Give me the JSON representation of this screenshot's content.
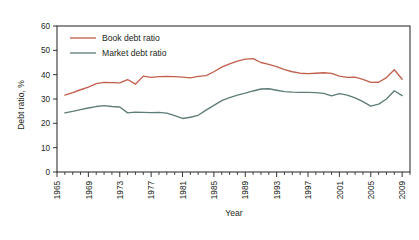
{
  "chart_data": {
    "type": "line",
    "title": "",
    "xlabel": "Year",
    "ylabel": "Debt ratio, %",
    "ylim": [
      0,
      60
    ],
    "xlim": [
      1965,
      2010
    ],
    "yticks": [
      0,
      10,
      20,
      30,
      40,
      50,
      60
    ],
    "xticks": [
      1965,
      1969,
      1973,
      1977,
      1981,
      1985,
      1989,
      1993,
      1997,
      2001,
      2005,
      2009
    ],
    "xtick_labels": [
      "1965",
      "1969",
      "1973",
      "1977",
      "1981",
      "1985",
      "1989",
      "1993",
      "1997",
      "2001",
      "2005",
      "2009"
    ],
    "ytick_labels": [
      "0",
      "10",
      "20",
      "30",
      "40",
      "50",
      "60"
    ],
    "grid": false,
    "legend_position": "top-left",
    "minor_ticks": "every year",
    "x": [
      1966,
      1967,
      1968,
      1969,
      1970,
      1971,
      1972,
      1973,
      1974,
      1975,
      1976,
      1977,
      1978,
      1979,
      1980,
      1981,
      1982,
      1983,
      1984,
      1985,
      1986,
      1987,
      1988,
      1989,
      1990,
      1991,
      1992,
      1993,
      1994,
      1995,
      1996,
      1997,
      1998,
      1999,
      2000,
      2001,
      2002,
      2003,
      2004,
      2005,
      2006,
      2007,
      2008,
      2009
    ],
    "series": [
      {
        "name": "Book debt ratio",
        "color": "#c2604e",
        "values": [
          31.6,
          32.6,
          33.8,
          34.9,
          36.3,
          36.8,
          36.7,
          36.6,
          38.0,
          36.1,
          39.4,
          38.9,
          39.2,
          39.3,
          39.2,
          39.0,
          38.7,
          39.3,
          39.6,
          41.2,
          43.1,
          44.4,
          45.6,
          46.4,
          46.6,
          45.0,
          44.2,
          43.3,
          42.1,
          41.2,
          40.6,
          40.4,
          40.6,
          40.8,
          40.5,
          39.4,
          38.9,
          39.0,
          38.1,
          36.8,
          36.9,
          38.8,
          42.0,
          38.1
        ]
      },
      {
        "name": "Market debt ratio",
        "color": "#5f7d78",
        "values": [
          24.3,
          24.9,
          25.6,
          26.3,
          26.9,
          27.3,
          26.9,
          26.7,
          24.3,
          24.6,
          24.5,
          24.4,
          24.5,
          24.2,
          23.2,
          22.0,
          22.5,
          23.3,
          25.4,
          27.4,
          29.3,
          30.6,
          31.6,
          32.4,
          33.3,
          34.1,
          34.2,
          33.6,
          33.0,
          32.8,
          32.7,
          32.7,
          32.6,
          32.3,
          31.3,
          32.2,
          31.6,
          30.5,
          28.9,
          27.1,
          27.9,
          30.0,
          33.4,
          31.4
        ]
      }
    ]
  },
  "legend": {
    "entries": [
      {
        "label": "Book debt ratio"
      },
      {
        "label": "Market debt ratio"
      }
    ]
  },
  "axes": {
    "y_title": "Debt ratio, %",
    "x_title": "Year"
  }
}
